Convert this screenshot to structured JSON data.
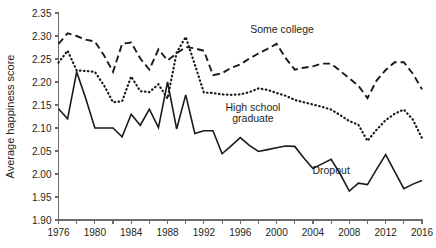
{
  "chart_data": {
    "type": "line",
    "title": "",
    "xlabel": "",
    "ylabel": "Average happiness score",
    "xlim": [
      1976,
      2016
    ],
    "ylim": [
      1.9,
      2.35
    ],
    "grid": false,
    "legend_position": "inline-annotations",
    "x_ticks": [
      1976,
      1978,
      1980,
      1982,
      1984,
      1986,
      1988,
      1990,
      1992,
      1994,
      1996,
      1998,
      2000,
      2002,
      2004,
      2006,
      2008,
      2010,
      2012,
      2014,
      2016
    ],
    "x_tick_labels": [
      "1976",
      "",
      "1980",
      "",
      "1984",
      "",
      "1988",
      "",
      "1992",
      "",
      "1996",
      "",
      "2000",
      "",
      "2004",
      "",
      "2008",
      "",
      "2012",
      "",
      "2016"
    ],
    "y_ticks": [
      1.9,
      1.95,
      2.0,
      2.05,
      2.1,
      2.15,
      2.2,
      2.25,
      2.3,
      2.35
    ],
    "y_tick_labels": [
      "1.90",
      "1.95",
      "2.00",
      "2.05",
      "2.10",
      "2.15",
      "2.20",
      "2.25",
      "2.30",
      "2.35"
    ],
    "x": [
      1976,
      1977,
      1978,
      1979,
      1980,
      1981,
      1982,
      1983,
      1984,
      1985,
      1986,
      1987,
      1988,
      1989,
      1990,
      1991,
      1992,
      1993,
      1994,
      1995,
      1996,
      1997,
      1998,
      1999,
      2000,
      2001,
      2002,
      2003,
      2004,
      2005,
      2006,
      2007,
      2008,
      2009,
      2010,
      2011,
      2012,
      2013,
      2014,
      2015,
      2016
    ],
    "series": [
      {
        "name": "Some college",
        "style": "dashed",
        "color": "#1a1a1a",
        "label": "Some college",
        "label_x": 2000.6,
        "label_y": 2.307,
        "values": [
          2.283,
          2.306,
          2.3,
          2.292,
          2.288,
          2.258,
          2.222,
          2.283,
          2.286,
          2.251,
          2.227,
          2.271,
          2.247,
          2.262,
          2.276,
          2.273,
          2.268,
          2.215,
          2.219,
          2.231,
          2.238,
          2.251,
          2.262,
          2.272,
          2.283,
          2.252,
          2.227,
          2.231,
          2.234,
          2.24,
          2.24,
          2.224,
          2.208,
          2.192,
          2.165,
          2.203,
          2.226,
          2.243,
          2.243,
          2.218,
          2.184
        ]
      },
      {
        "name": "High school graduate",
        "style": "dotted",
        "color": "#1a1a1a",
        "label_lines": [
          "High school",
          "graduate"
        ],
        "label_x": 1997.4,
        "label_y": 2.137,
        "values": [
          2.242,
          2.268,
          2.225,
          2.224,
          2.222,
          2.193,
          2.156,
          2.158,
          2.212,
          2.18,
          2.178,
          2.195,
          2.164,
          2.264,
          2.298,
          2.238,
          2.177,
          2.176,
          2.173,
          2.172,
          2.173,
          2.178,
          2.186,
          2.183,
          2.176,
          2.17,
          2.161,
          2.156,
          2.151,
          2.146,
          2.14,
          2.128,
          2.115,
          2.107,
          2.072,
          2.096,
          2.117,
          2.131,
          2.14,
          2.118,
          2.078
        ]
      },
      {
        "name": "Dropout",
        "style": "solid",
        "color": "#1a1a1a",
        "label": "Dropout",
        "label_x": 2006.0,
        "label_y": 2.0,
        "values": [
          2.142,
          2.12,
          2.222,
          2.164,
          2.1,
          2.1,
          2.1,
          2.081,
          2.13,
          2.106,
          2.141,
          2.101,
          2.2,
          2.098,
          2.172,
          2.088,
          2.094,
          2.094,
          2.044,
          2.061,
          2.079,
          2.062,
          2.049,
          2.053,
          2.057,
          2.061,
          2.06,
          2.035,
          2.012,
          2.022,
          2.032,
          2.0,
          1.963,
          1.98,
          1.977,
          2.01,
          2.042,
          2.005,
          1.968,
          1.978,
          1.986
        ]
      }
    ]
  }
}
